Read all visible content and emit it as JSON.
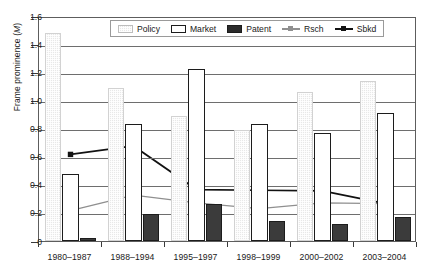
{
  "chart_data": {
    "type": "bar",
    "title": "",
    "xlabel": "",
    "ylabel": "Frame prominence (M)",
    "ylabel_plain": "Frame prominence (",
    "ylabel_italic": "M",
    "ylabel_tail": ")",
    "ylim": [
      0,
      1.6
    ],
    "ytick_values": [
      "1.6",
      "1.4",
      "1.2",
      "1.0",
      "0.8",
      "0.6",
      "0.4",
      "0.2",
      "0"
    ],
    "ytick_numbers": [
      1.6,
      1.4,
      1.2,
      1.0,
      0.8,
      0.6,
      0.4,
      0.2,
      0
    ],
    "grid": true,
    "grid_orientation": "horizontal",
    "legend_position": "top-center",
    "categories": [
      "1980–1987",
      "1988–1994",
      "1995–1997",
      "1998–1999",
      "2000–2002",
      "2003–2004"
    ],
    "series": [
      {
        "name": "Policy",
        "kind": "bar",
        "color": "#e8e8e8",
        "values": [
          1.48,
          1.09,
          0.89,
          0.79,
          1.06,
          1.14
        ]
      },
      {
        "name": "Market",
        "kind": "bar",
        "color": "#ffffff",
        "values": [
          0.48,
          0.83,
          1.22,
          0.83,
          0.77,
          0.91
        ]
      },
      {
        "name": "Patent",
        "kind": "bar",
        "color": "#3b3b3b",
        "values": [
          0.02,
          0.19,
          0.26,
          0.14,
          0.12,
          0.17
        ]
      },
      {
        "name": "Rsch",
        "kind": "line",
        "color": "#8f8f8f",
        "values": [
          0.23,
          0.34,
          0.285,
          0.245,
          0.285,
          0.28
        ]
      },
      {
        "name": "Sbkd",
        "kind": "line",
        "color": "#121212",
        "values": [
          0.63,
          0.69,
          0.38,
          0.375,
          0.37,
          0.28
        ]
      }
    ]
  },
  "legend": {
    "items": [
      {
        "label": "Policy",
        "marker": "swatch-hatched-light"
      },
      {
        "label": "Market",
        "marker": "swatch-outlined-white"
      },
      {
        "label": "Patent",
        "marker": "swatch-filled-dark"
      },
      {
        "label": "Rsch",
        "marker": "line-square-gray"
      },
      {
        "label": "Sbkd",
        "marker": "line-square-black"
      }
    ]
  }
}
